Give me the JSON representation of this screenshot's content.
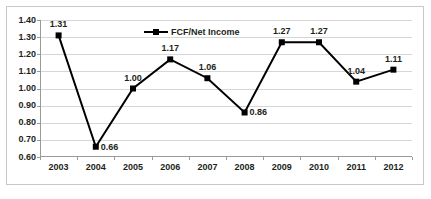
{
  "chart_data": {
    "type": "line",
    "title": "",
    "subtitle": "",
    "xlabel": "",
    "ylabel": "",
    "categories": [
      "2003",
      "2004",
      "2005",
      "2006",
      "2007",
      "2008",
      "2009",
      "2010",
      "2011",
      "2012"
    ],
    "series": [
      {
        "name": "FCF/Net Income",
        "values": [
          1.31,
          0.66,
          1.0,
          1.17,
          1.06,
          0.86,
          1.27,
          1.27,
          1.04,
          1.11
        ],
        "color": "#000000",
        "marker": "square",
        "labels": [
          "1.31",
          "0.66",
          "1.00",
          "1.17",
          "1.06",
          "0.86",
          "1.27",
          "1.27",
          "1.04",
          "1.11"
        ],
        "label_positions": [
          "above",
          "right",
          "above",
          "above",
          "above",
          "right",
          "above",
          "above",
          "above",
          "above"
        ]
      }
    ],
    "ylim": [
      0.6,
      1.4
    ],
    "ytick_step": 0.1,
    "ytick_labels": [
      "1.40",
      "1.30",
      "1.20",
      "1.10",
      "1.00",
      "0.90",
      "0.80",
      "0.70",
      "0.60"
    ],
    "grid": true,
    "grid_axis": "y",
    "legend": {
      "position": "top-center",
      "entries": [
        {
          "label": "FCF/Net Income",
          "color": "#000000"
        }
      ]
    },
    "colors": {
      "series": "#000000",
      "grid": "#d6d6d6",
      "axis": "#9a9a9a",
      "frame": "#c9c9c9",
      "text": "#231f20",
      "background": "#ffffff"
    }
  }
}
